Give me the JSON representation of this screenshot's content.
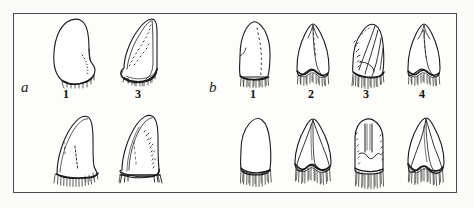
{
  "figure": {
    "kind": "scientific-illustration-plate",
    "background_color": "#fbfbf9",
    "frame_color": "#4a4a4a",
    "ink_color": "#1a1a1a"
  },
  "groups": [
    {
      "label": "a",
      "label_style": "italic",
      "specimens": [
        {
          "number": "1",
          "views": [
            "upper",
            "lower"
          ]
        },
        {
          "number": "3",
          "views": [
            "upper",
            "lower"
          ]
        }
      ]
    },
    {
      "label": "b",
      "label_style": "italic",
      "specimens": [
        {
          "number": "1",
          "views": [
            "upper",
            "lower"
          ]
        },
        {
          "number": "2",
          "views": [
            "upper",
            "lower"
          ]
        },
        {
          "number": "3",
          "views": [
            "upper",
            "lower"
          ]
        },
        {
          "number": "4",
          "views": [
            "upper",
            "lower"
          ]
        }
      ]
    }
  ],
  "labels": {
    "group_a": "a",
    "group_b": "b",
    "a_spec_1": "1",
    "a_spec_3": "3",
    "b_spec_1": "1",
    "b_spec_2": "2",
    "b_spec_3": "3",
    "b_spec_4": "4"
  }
}
